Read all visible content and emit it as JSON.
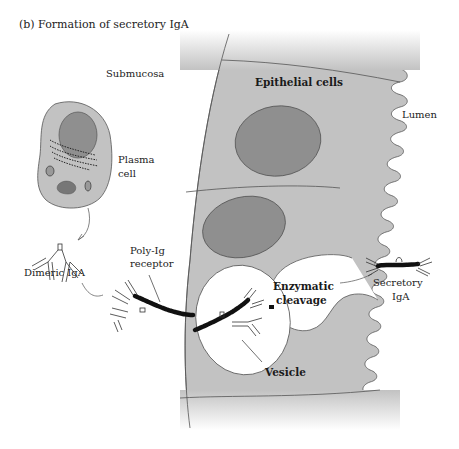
{
  "figure": {
    "title": "(b)  Formation of secretory IgA"
  },
  "labels": {
    "submucosa": "Submucosa",
    "epithelial_cells": "Epithelial cells",
    "lumen": "Lumen",
    "plasma_cell_line1": "Plasma",
    "plasma_cell_line2": "cell",
    "dimeric_iga": "Dimeric IgA",
    "poly_ig_line1": "Poly-Ig",
    "poly_ig_line2": "receptor",
    "enzymatic_line1": "Enzymatic",
    "enzymatic_line2": "cleavage",
    "secretory_line1": "Secretory",
    "secretory_line2": "IgA",
    "vesicle": "Vesicle"
  },
  "colors": {
    "cell_fill": "#c2c2c2",
    "nucleus_fill": "#8f8f8f",
    "outline": "#444444",
    "receptor": "#111111",
    "background": "#ffffff"
  }
}
